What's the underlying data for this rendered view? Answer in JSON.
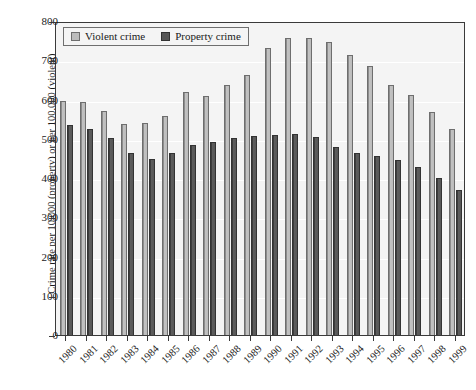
{
  "chart_data": {
    "type": "bar",
    "title": "",
    "xlabel": "",
    "ylabel": "Crime rate per 10,000 (property) or per 100,000 (violent)",
    "ylim": [
      0,
      800
    ],
    "yticks": [
      0,
      100,
      200,
      300,
      400,
      500,
      600,
      700,
      800
    ],
    "grid": true,
    "legend_position": "top-left",
    "categories": [
      "1980",
      "1981",
      "1982",
      "1983",
      "1984",
      "1985",
      "1986",
      "1987",
      "1988",
      "1989",
      "1990",
      "1991",
      "1992",
      "1993",
      "1994",
      "1995",
      "1996",
      "1997",
      "1998",
      "1999"
    ],
    "series": [
      {
        "name": "Violent crime",
        "color": "#bcbcbc",
        "values": [
          597,
          594,
          571,
          538,
          539,
          557,
          618,
          610,
          637,
          663,
          732,
          758,
          758,
          747,
          714,
          685,
          637,
          611,
          567,
          525
        ]
      },
      {
        "name": "Property crime",
        "color": "#575757",
        "values": [
          534,
          524,
          501,
          465,
          449,
          463,
          485,
          492,
          501,
          506,
          509,
          513,
          505,
          480,
          463,
          456,
          446,
          429,
          400,
          370
        ]
      }
    ]
  },
  "legend": {
    "items": [
      {
        "label": "Violent crime",
        "swatch": "violent"
      },
      {
        "label": "Property crime",
        "swatch": "property"
      }
    ]
  },
  "colors": {
    "violent_fill": "#bcbcbc",
    "violent_edge": "#6e6e6e",
    "property_fill": "#575757",
    "property_edge": "#333333",
    "plot_background": "#f4f4f4",
    "gridline": "#ffffff",
    "axis": "#3a3a3a"
  }
}
